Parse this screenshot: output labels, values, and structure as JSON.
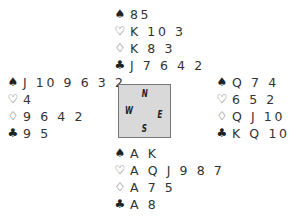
{
  "header_clipped": "······",
  "suits": {
    "spades": "♠",
    "hearts": "♡",
    "diamonds": "♢",
    "clubs": "♣"
  },
  "hands": {
    "north": {
      "spades": "85",
      "hearts": "K 10 3",
      "diamonds": "K 8 3",
      "clubs": "J 7 6 4 2"
    },
    "west": {
      "spades": "J 10 9 6 3 2",
      "hearts": "4",
      "diamonds": "9 6 4 2",
      "clubs": "9 5"
    },
    "east": {
      "spades": "Q 7 4",
      "hearts": "6 5 2",
      "diamonds": "Q J 10",
      "clubs": "K Q 10 3"
    },
    "south": {
      "spades": "A K",
      "hearts": "A Q J 9 8 7",
      "diamonds": "A 7 5",
      "clubs": "A 8"
    }
  },
  "compass": {
    "north": "N",
    "south": "S",
    "east": "E",
    "west": "W",
    "fill": "#d9d9d9"
  }
}
